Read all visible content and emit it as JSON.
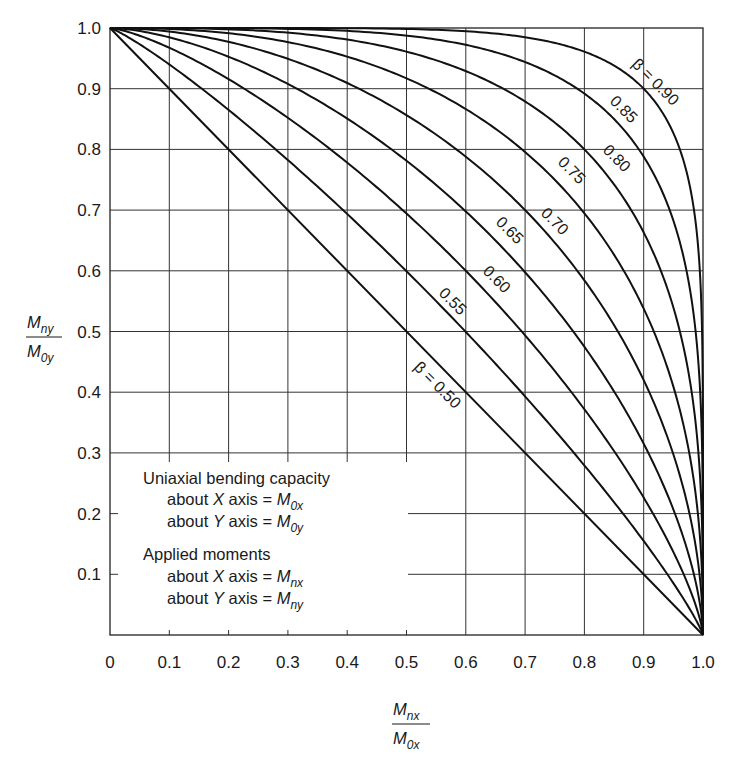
{
  "chart_data": {
    "type": "line",
    "title": "",
    "xlabel": "M_nx / M_0x",
    "ylabel": "M_ny / M_0y",
    "xlim": [
      0,
      1.0
    ],
    "ylim": [
      0,
      1.0
    ],
    "grid": true,
    "x_ticks": [
      "0",
      "0.1",
      "0.2",
      "0.3",
      "0.4",
      "0.5",
      "0.6",
      "0.7",
      "0.8",
      "0.9",
      "1.0"
    ],
    "y_ticks": [
      "1.0",
      "0.9",
      "0.8",
      "0.7",
      "0.6",
      "0.5",
      "0.4",
      "0.3",
      "0.2",
      "0.1"
    ],
    "series": [
      {
        "name": "β = 0.50",
        "beta": 0.5,
        "label": "β = 0.50",
        "note": "straight line from (0,1) to (1,0)"
      },
      {
        "name": "0.55",
        "beta": 0.55,
        "label": "0.55"
      },
      {
        "name": "0.60",
        "beta": 0.6,
        "label": "0.60"
      },
      {
        "name": "0.65",
        "beta": 0.65,
        "label": "0.65"
      },
      {
        "name": "0.70",
        "beta": 0.7,
        "label": "0.70"
      },
      {
        "name": "0.75",
        "beta": 0.75,
        "label": "0.75"
      },
      {
        "name": "0.80",
        "beta": 0.8,
        "label": "0.80"
      },
      {
        "name": "0.85",
        "beta": 0.85,
        "label": "0.85"
      },
      {
        "name": "β = 0.90",
        "beta": 0.9,
        "label": "β = 0.90"
      }
    ],
    "curve_equation": "(Mnx/M0x)^(log0.5/logβ) + (Mny/M0y)^(log0.5/logβ) = 1",
    "annotations": [
      "Uniaxial bending capacity",
      "about X axis = M0x",
      "about Y axis = M0y",
      "Applied moments",
      "about X axis = Mnx",
      "about Y axis = Mny"
    ],
    "legend": {
      "position": "none (inline curve labels)"
    }
  },
  "legend_box": {
    "heading1": "Uniaxial bending capacity",
    "about_x": "about ",
    "x_var": "X",
    "axis_eq": " axis = ",
    "y_var": "Y",
    "M": "M",
    "sub_0x": "0x",
    "sub_0y": "0y",
    "heading2": "Applied moments",
    "sub_nx": "nx",
    "sub_ny": "ny"
  },
  "axes": {
    "ylabel_num_M": "M",
    "ylabel_num_sub": "ny",
    "ylabel_den_M": "M",
    "ylabel_den_sub": "0y",
    "xlabel_num_M": "M",
    "xlabel_num_sub": "nx",
    "xlabel_den_M": "M",
    "xlabel_den_sub": "0x"
  }
}
